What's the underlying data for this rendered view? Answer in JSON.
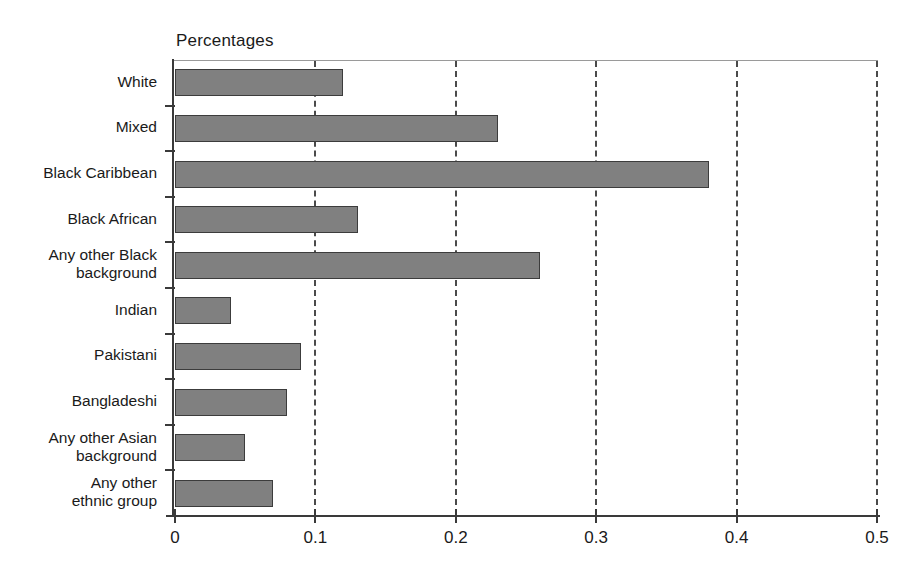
{
  "chart_data": {
    "type": "bar",
    "orientation": "horizontal",
    "title": "Percentages",
    "xlabel": "",
    "ylabel": "",
    "xlim": [
      0,
      0.5
    ],
    "xticks": [
      0,
      0.1,
      0.2,
      0.3,
      0.4,
      0.5
    ],
    "xtick_labels": [
      "0",
      "0.1",
      "0.2",
      "0.3",
      "0.4",
      "0.5"
    ],
    "grid": "vertical-dashed",
    "legend": "none",
    "bar_fill": "#808080",
    "bar_edge": "#3c3c3c",
    "categories": [
      "White",
      "Mixed",
      "Black Caribbean",
      "Black African",
      "Any other Black\nbackground",
      "Indian",
      "Pakistani",
      "Bangladeshi",
      "Any other Asian\nbackground",
      "Any other\nethnic group"
    ],
    "values": [
      0.12,
      0.23,
      0.38,
      0.13,
      0.26,
      0.04,
      0.09,
      0.08,
      0.05,
      0.07
    ]
  }
}
